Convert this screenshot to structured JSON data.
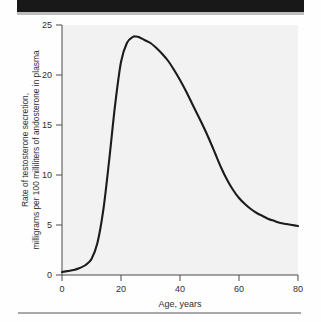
{
  "figure": {
    "background_color": "#fefefe",
    "plot_background_color": "#f2f2f2",
    "curve_color": "#1c1c1c",
    "axis_color": "#4a4a4a",
    "top_bar_color": "#181818",
    "bottom_rule_color": "#a8a8a8"
  },
  "chart_data": {
    "type": "line",
    "title": "",
    "subtitle": "",
    "xlabel": "Age, years",
    "ylabel": "Rate of testosterone secretion, milligrams per 100 milliliters of andosterone in plasma",
    "ylabel_line1": "Rate of testosterone secretion,",
    "ylabel_line2": "milligrams per 100 milliliters of andosterone in plasma",
    "xlim": [
      0,
      80
    ],
    "ylim": [
      0,
      25
    ],
    "xticks": [
      0,
      20,
      40,
      60,
      80
    ],
    "xtick_labels": [
      "0",
      "20",
      "40",
      "60",
      "80"
    ],
    "yticks": [
      0,
      5,
      10,
      15,
      20,
      25
    ],
    "ytick_labels": [
      "0",
      "5",
      "10",
      "15",
      "20",
      "25"
    ],
    "grid": false,
    "legend": null,
    "legend_position": "none",
    "x": [
      0,
      2,
      4,
      6,
      8,
      10,
      12,
      14,
      16,
      18,
      20,
      22,
      24,
      25,
      26,
      28,
      30,
      32,
      34,
      36,
      38,
      40,
      42,
      44,
      46,
      48,
      50,
      52,
      54,
      56,
      58,
      60,
      62,
      64,
      66,
      68,
      70,
      72,
      74,
      76,
      78,
      80
    ],
    "values": [
      0.3,
      0.4,
      0.5,
      0.7,
      1.0,
      1.6,
      3.2,
      6.5,
      11.5,
      17.0,
      21.3,
      23.2,
      23.8,
      23.85,
      23.8,
      23.5,
      23.2,
      22.7,
      22.1,
      21.4,
      20.5,
      19.5,
      18.4,
      17.2,
      16.0,
      14.8,
      13.5,
      12.1,
      10.7,
      9.5,
      8.5,
      7.7,
      7.1,
      6.6,
      6.2,
      5.9,
      5.6,
      5.4,
      5.2,
      5.1,
      5.0,
      4.9
    ],
    "series": [
      {
        "name": "Rate of testosterone secretion",
        "values": [
          0.3,
          0.4,
          0.5,
          0.7,
          1.0,
          1.6,
          3.2,
          6.5,
          11.5,
          17.0,
          21.3,
          23.2,
          23.8,
          23.85,
          23.8,
          23.5,
          23.2,
          22.7,
          22.1,
          21.4,
          20.5,
          19.5,
          18.4,
          17.2,
          16.0,
          14.8,
          13.5,
          12.1,
          10.7,
          9.5,
          8.5,
          7.7,
          7.1,
          6.6,
          6.2,
          5.9,
          5.6,
          5.4,
          5.2,
          5.1,
          5.0,
          4.9
        ]
      }
    ],
    "annotations": [],
    "peak": {
      "x": 25,
      "y": 23.85
    }
  }
}
